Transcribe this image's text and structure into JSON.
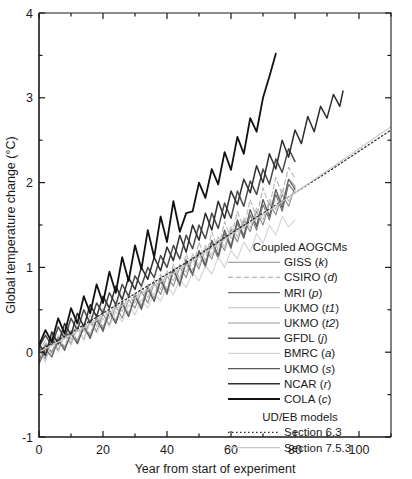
{
  "chart_data": {
    "type": "line",
    "title": "",
    "xlabel": "Year from start of experiment",
    "ylabel": "Global temperature change (°C)",
    "xlim": [
      0,
      110
    ],
    "ylim": [
      -1,
      4
    ],
    "xticks": [
      0,
      20,
      40,
      60,
      80,
      100
    ],
    "xticklabels": [
      "0",
      "20",
      "40",
      "60",
      "80",
      "100"
    ],
    "xminorticks": [
      10,
      30,
      50,
      70,
      90,
      110
    ],
    "yticks": [
      -1,
      0,
      1,
      2,
      3,
      4
    ],
    "yticklabels": [
      "-1",
      "0",
      "1",
      "2",
      "3",
      "4"
    ],
    "yminorticks": [
      -0.5,
      0.5,
      1.5,
      2.5,
      3.5
    ],
    "grid": false,
    "legend_position": "lower-right-inside",
    "series": [
      {
        "name": "GISS (k)",
        "label_main": "GISS",
        "label_italic": "k",
        "group": "Coupled AOGCMs",
        "color": "#8a8a8a",
        "width": 1.1,
        "dash": "none",
        "x": [
          0,
          2,
          4,
          6,
          8,
          10,
          12,
          14,
          16,
          18,
          20,
          22,
          24,
          26,
          28,
          30,
          32,
          34,
          36,
          38,
          40,
          42,
          44,
          46,
          48,
          50,
          52,
          54,
          56,
          58,
          60,
          62,
          64,
          66,
          68,
          70,
          72,
          74,
          76,
          78,
          80
        ],
        "y": [
          0.05,
          -0.08,
          0.18,
          0.02,
          0.22,
          0.1,
          0.3,
          0.15,
          0.38,
          0.24,
          0.45,
          0.32,
          0.55,
          0.4,
          0.62,
          0.52,
          0.72,
          0.58,
          0.82,
          0.68,
          0.9,
          0.78,
          1.0,
          0.88,
          1.12,
          0.98,
          1.22,
          1.1,
          1.32,
          1.2,
          1.45,
          1.3,
          1.55,
          1.42,
          1.66,
          1.5,
          1.76,
          1.62,
          1.86,
          1.72,
          1.95
        ]
      },
      {
        "name": "CSIRO (d)",
        "label_main": "CSIRO",
        "label_italic": "d",
        "group": "Coupled AOGCMs",
        "color": "#b4b4b4",
        "width": 1.1,
        "dash": "5,3",
        "x": [
          0,
          2,
          4,
          6,
          8,
          10,
          12,
          14,
          16,
          18,
          20,
          22,
          24,
          26,
          28,
          30,
          32,
          34,
          36,
          38,
          40,
          42,
          44,
          46,
          48,
          50,
          52,
          54,
          56,
          58,
          60,
          62,
          64,
          66,
          68,
          70,
          72,
          74,
          76,
          78,
          80
        ],
        "y": [
          0.0,
          0.14,
          -0.05,
          0.2,
          0.06,
          0.26,
          0.12,
          0.34,
          0.2,
          0.42,
          0.3,
          0.5,
          0.38,
          0.6,
          0.46,
          0.7,
          0.56,
          0.8,
          0.64,
          0.92,
          0.74,
          1.04,
          0.86,
          1.16,
          0.96,
          1.3,
          1.08,
          1.42,
          1.2,
          1.54,
          1.34,
          1.66,
          1.46,
          1.8,
          1.58,
          1.94,
          1.72,
          2.06,
          1.86,
          2.18,
          2.05
        ]
      },
      {
        "name": "MRI (p)",
        "label_main": "MRI",
        "label_italic": "p",
        "group": "Coupled AOGCMs",
        "color": "#6e6e6e",
        "width": 1.1,
        "dash": "none",
        "x": [
          0,
          2,
          4,
          6,
          8,
          10,
          12,
          14,
          16,
          18,
          20,
          22,
          24,
          26,
          28,
          30,
          32,
          34,
          36,
          38,
          40,
          42,
          44,
          46,
          48,
          50,
          52,
          54,
          56,
          58,
          60,
          62,
          64,
          66,
          68,
          70,
          72,
          74,
          76,
          78,
          80
        ],
        "y": [
          -0.1,
          0.08,
          0.0,
          0.16,
          0.04,
          0.24,
          0.1,
          0.3,
          0.18,
          0.4,
          0.24,
          0.48,
          0.34,
          0.56,
          0.42,
          0.66,
          0.5,
          0.74,
          0.6,
          0.84,
          0.68,
          0.96,
          0.78,
          1.06,
          0.9,
          1.18,
          1.0,
          1.3,
          1.1,
          1.4,
          1.22,
          1.52,
          1.34,
          1.62,
          1.44,
          1.74,
          1.56,
          1.86,
          1.66,
          1.98,
          1.88
        ]
      },
      {
        "name": "UKMO (t1)",
        "label_main": "UKMO",
        "label_italic": "t1",
        "group": "Coupled AOGCMs",
        "color": "#c0c0c0",
        "width": 1.1,
        "dash": "none",
        "x": [
          0,
          2,
          4,
          6,
          8,
          10,
          12,
          14,
          16,
          18,
          20,
          22,
          24,
          26,
          28,
          30,
          32,
          34,
          36,
          38,
          40,
          42,
          44,
          46,
          48,
          50,
          52,
          54,
          56,
          58,
          60,
          62,
          64,
          66,
          68,
          70,
          72,
          74,
          76,
          78,
          80
        ],
        "y": [
          0.12,
          -0.02,
          0.22,
          0.08,
          0.3,
          0.14,
          0.36,
          0.24,
          0.44,
          0.3,
          0.52,
          0.4,
          0.6,
          0.48,
          0.68,
          0.58,
          0.78,
          0.64,
          0.86,
          0.74,
          0.96,
          0.84,
          1.04,
          0.94,
          1.16,
          1.02,
          1.26,
          1.14,
          1.36,
          1.24,
          1.48,
          1.36,
          1.58,
          1.46,
          1.7,
          1.56,
          1.8,
          1.68,
          1.92,
          1.78,
          1.9
        ]
      },
      {
        "name": "UKMO (t2)",
        "label_main": "UKMO",
        "label_italic": "t2",
        "group": "Coupled AOGCMs",
        "color": "#9a9a9a",
        "width": 1.1,
        "dash": "none",
        "x": [
          0,
          2,
          4,
          6,
          8,
          10,
          12,
          14,
          16,
          18,
          20,
          22,
          24,
          26,
          28,
          30,
          32,
          34,
          36,
          38,
          40,
          42,
          44,
          46,
          48,
          50,
          52,
          54,
          56,
          58,
          60,
          62,
          64,
          66,
          68,
          70,
          72,
          74,
          76,
          78,
          80
        ],
        "y": [
          -0.05,
          0.1,
          0.0,
          0.18,
          0.05,
          0.25,
          0.14,
          0.32,
          0.2,
          0.42,
          0.28,
          0.5,
          0.36,
          0.6,
          0.44,
          0.68,
          0.54,
          0.78,
          0.62,
          0.88,
          0.72,
          0.98,
          0.82,
          1.1,
          0.92,
          1.2,
          1.04,
          1.32,
          1.14,
          1.44,
          1.26,
          1.56,
          1.38,
          1.68,
          1.5,
          1.8,
          1.6,
          1.92,
          1.74,
          2.04,
          1.96
        ]
      },
      {
        "name": "GFDL (j)",
        "label_main": "GFDL",
        "label_italic": "j",
        "group": "Coupled AOGCMs",
        "color": "#4a4a4a",
        "width": 1.5,
        "dash": "none",
        "x": [
          0,
          2,
          4,
          6,
          8,
          10,
          12,
          14,
          16,
          18,
          20,
          22,
          24,
          26,
          28,
          30,
          32,
          34,
          36,
          38,
          40,
          42,
          44,
          46,
          48,
          50,
          52,
          54,
          56,
          58,
          60,
          62,
          64,
          66,
          68,
          70,
          72,
          74,
          76,
          78,
          80
        ],
        "y": [
          0.06,
          0.2,
          0.08,
          0.3,
          0.16,
          0.4,
          0.26,
          0.5,
          0.34,
          0.58,
          0.46,
          0.7,
          0.56,
          0.8,
          0.66,
          0.9,
          0.78,
          1.0,
          0.88,
          1.14,
          1.0,
          1.26,
          1.1,
          1.38,
          1.22,
          1.5,
          1.34,
          1.64,
          1.46,
          1.76,
          1.58,
          1.9,
          1.72,
          2.02,
          1.86,
          2.16,
          1.98,
          2.28,
          2.12,
          2.4,
          2.25
        ]
      },
      {
        "name": "BMRC (a)",
        "label_main": "BMRC",
        "label_italic": "a",
        "group": "Coupled AOGCMs",
        "color": "#d2d2d2",
        "width": 1.1,
        "dash": "none",
        "x": [
          0,
          2,
          4,
          6,
          8,
          10,
          12,
          14,
          16,
          18,
          20,
          22,
          24,
          26,
          28,
          30,
          32,
          34,
          36,
          38,
          40,
          42,
          44,
          46,
          48,
          50,
          52,
          54,
          56,
          58,
          60,
          62,
          64,
          66,
          68,
          70,
          72,
          74,
          76,
          78,
          80
        ],
        "y": [
          0.02,
          -0.12,
          0.14,
          0.0,
          0.2,
          0.08,
          0.28,
          0.16,
          0.34,
          0.22,
          0.4,
          0.3,
          0.48,
          0.36,
          0.56,
          0.44,
          0.62,
          0.52,
          0.7,
          0.6,
          0.78,
          0.68,
          0.86,
          0.76,
          0.94,
          0.84,
          1.02,
          0.92,
          1.12,
          1.0,
          1.2,
          1.1,
          1.3,
          1.18,
          1.4,
          1.28,
          1.5,
          1.38,
          1.6,
          1.48,
          1.56
        ]
      },
      {
        "name": "UKMO (s)",
        "label_main": "UKMO",
        "label_italic": "s",
        "group": "Coupled AOGCMs",
        "color": "#5a5a5a",
        "width": 1.1,
        "dash": "none",
        "x": [
          0,
          2,
          4,
          6,
          8,
          10,
          12,
          14,
          16,
          18,
          20,
          22,
          24,
          26,
          28,
          30,
          32,
          34,
          36,
          38,
          40,
          42,
          44,
          46,
          48,
          50,
          52,
          54,
          56,
          58,
          60,
          62,
          64,
          66,
          68,
          70,
          72,
          74,
          76,
          78,
          80
        ],
        "y": [
          -0.14,
          0.04,
          -0.06,
          0.14,
          0.02,
          0.22,
          0.1,
          0.3,
          0.16,
          0.38,
          0.26,
          0.48,
          0.34,
          0.58,
          0.42,
          0.66,
          0.52,
          0.76,
          0.6,
          0.86,
          0.7,
          0.98,
          0.8,
          1.08,
          0.92,
          1.2,
          1.02,
          1.32,
          1.14,
          1.44,
          1.24,
          1.56,
          1.36,
          1.68,
          1.48,
          1.8,
          1.6,
          1.92,
          1.7,
          2.04,
          1.92
        ]
      },
      {
        "name": "NCAR (r)",
        "label_main": "NCAR",
        "label_italic": "r",
        "group": "Coupled AOGCMs",
        "color": "#2e2e2e",
        "width": 1.5,
        "dash": "none",
        "x": [
          0,
          2,
          4,
          6,
          8,
          10,
          12,
          14,
          16,
          18,
          20,
          22,
          24,
          26,
          28,
          30,
          32,
          34,
          36,
          38,
          40,
          42,
          44,
          46,
          48,
          50,
          52,
          54,
          56,
          58,
          60,
          62,
          64,
          66,
          68,
          70,
          72,
          74,
          76,
          78,
          80,
          82,
          84,
          86,
          88,
          90,
          92,
          94,
          95
        ],
        "y": [
          0.1,
          -0.04,
          0.24,
          0.1,
          0.34,
          0.2,
          0.46,
          0.3,
          0.56,
          0.42,
          0.66,
          0.52,
          0.78,
          0.62,
          0.88,
          0.74,
          1.0,
          0.86,
          1.12,
          0.96,
          1.24,
          1.08,
          1.38,
          1.18,
          1.5,
          1.32,
          1.64,
          1.44,
          1.78,
          1.58,
          1.9,
          1.74,
          2.04,
          1.88,
          2.2,
          2.0,
          2.34,
          2.16,
          2.5,
          2.3,
          2.62,
          2.46,
          2.78,
          2.6,
          2.9,
          2.76,
          3.04,
          2.9,
          3.08
        ]
      },
      {
        "name": "COLA (c)",
        "label_main": "COLA",
        "label_italic": "c",
        "group": "Coupled AOGCMs",
        "color": "#111111",
        "width": 1.8,
        "dash": "none",
        "x": [
          0,
          2,
          4,
          6,
          8,
          10,
          12,
          14,
          16,
          18,
          20,
          22,
          24,
          26,
          28,
          30,
          32,
          34,
          36,
          38,
          40,
          42,
          44,
          46,
          48,
          50,
          52,
          54,
          56,
          58,
          60,
          62,
          64,
          66,
          68,
          70,
          72,
          74
        ],
        "y": [
          0.08,
          0.26,
          0.12,
          0.4,
          0.22,
          0.52,
          0.34,
          0.66,
          0.46,
          0.8,
          0.58,
          0.95,
          0.7,
          1.12,
          0.84,
          1.26,
          0.98,
          1.44,
          1.12,
          1.6,
          1.3,
          1.78,
          1.42,
          1.64,
          1.66,
          2.0,
          1.82,
          2.16,
          1.98,
          2.36,
          2.15,
          2.54,
          2.34,
          2.76,
          2.6,
          3.0,
          3.25,
          3.52
        ]
      },
      {
        "name": "Section 6.3",
        "label_main": "Section 6.3",
        "label_italic": "",
        "group": "UD/EB models",
        "color": "#222222",
        "width": 1.2,
        "dash": "1.5,2.5",
        "x": [
          0,
          10,
          20,
          30,
          40,
          50,
          60,
          70,
          80,
          90,
          100,
          110
        ],
        "y": [
          0.02,
          0.23,
          0.46,
          0.69,
          0.92,
          1.15,
          1.4,
          1.64,
          1.88,
          2.12,
          2.37,
          2.62
        ]
      },
      {
        "name": "Section 7.5.3",
        "label_main": "Section 7.5.3",
        "label_italic": "",
        "group": "UD/EB models",
        "color": "#c8c8c8",
        "width": 1.2,
        "dash": "none",
        "x": [
          0,
          10,
          20,
          30,
          40,
          50,
          60,
          70,
          80,
          90,
          100,
          110
        ],
        "y": [
          0.0,
          0.2,
          0.42,
          0.64,
          0.88,
          1.12,
          1.38,
          1.62,
          1.88,
          2.14,
          2.4,
          2.66
        ]
      }
    ]
  },
  "legend": {
    "group_headers": [
      "Coupled AOGCMs",
      "UD/EB models"
    ]
  }
}
